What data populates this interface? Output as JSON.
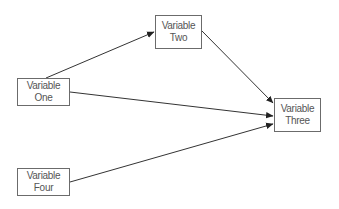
{
  "diagram": {
    "type": "path-diagram",
    "nodes": [
      {
        "id": "one",
        "line1": "Variable",
        "line2": "One"
      },
      {
        "id": "two",
        "line1": "Variable",
        "line2": "Two"
      },
      {
        "id": "three",
        "line1": "Variable",
        "line2": "Three"
      },
      {
        "id": "four",
        "line1": "Variable",
        "line2": "Four"
      }
    ],
    "edges": [
      {
        "from": "Variable One",
        "to": "Variable Two"
      },
      {
        "from": "Variable Two",
        "to": "Variable Three"
      },
      {
        "from": "Variable One",
        "to": "Variable Three"
      },
      {
        "from": "Variable Four",
        "to": "Variable Three"
      }
    ],
    "colors": {
      "line": "#333333",
      "box_border": "#6b6b6b",
      "text": "#555555"
    }
  }
}
